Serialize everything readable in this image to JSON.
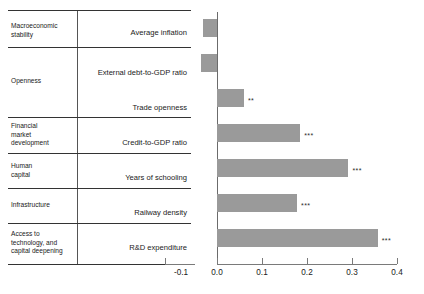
{
  "chart_data": {
    "type": "bar",
    "orientation": "horizontal",
    "title": "",
    "xlabel": "",
    "ylabel": "",
    "xlim": [
      -0.1,
      0.4
    ],
    "grid": false,
    "legend": false,
    "xticks": [
      "-0.1",
      "0.0",
      "0.1",
      "0.2",
      "0.3",
      "0.4"
    ],
    "xtick_values": [
      -0.1,
      0.0,
      0.1,
      0.2,
      0.3,
      0.4
    ],
    "bar_color": "#9a9a9a",
    "axis_color": "#7a7a7a",
    "categories": [
      "Average inflation",
      "External debt-to-GDP ratio",
      "Trade openness",
      "Credit-to-GDP ratio",
      "Years of schooling",
      "Railway density",
      "R&D expenditure"
    ],
    "values": [
      -0.031,
      -0.036,
      0.06,
      0.185,
      0.292,
      0.178,
      0.357
    ],
    "annotations": [
      "",
      "",
      "**",
      "***",
      "***",
      "***",
      "***"
    ],
    "groups": [
      "Macroeconomic stability",
      "Openness",
      "Financial market development",
      "Human capital",
      "Infrastructure",
      "Access to technology, and capital deepening"
    ]
  },
  "table": {
    "groups": [
      {
        "label": "Macroeconomic\nstability",
        "rows": [
          "Average inflation"
        ]
      },
      {
        "label": "Openness",
        "rows": [
          "External debt-to-GDP ratio",
          "Trade openness"
        ]
      },
      {
        "label": "Financial\nmarket\ndevelopment",
        "rows": [
          "Credit-to-GDP ratio"
        ]
      },
      {
        "label": "Human\ncapital",
        "rows": [
          "Years of schooling"
        ]
      },
      {
        "label": "Infrastructure",
        "rows": [
          "Railway density"
        ]
      },
      {
        "label": "Access to\ntechnology, and\ncapital deepening",
        "rows": [
          "R&D expenditure"
        ]
      }
    ],
    "group_labels": [
      "Macroeconomic stability",
      "Openness",
      "Financial market development",
      "Human capital",
      "Infrastructure",
      "Access to technology, and capital deepening"
    ],
    "indicator_labels": [
      "Average inflation",
      "External debt-to-GDP ratio",
      "Trade openness",
      "Credit-to-GDP ratio",
      "Years of schooling",
      "Railway density",
      "R&D expenditure"
    ]
  },
  "group_label_lines": {
    "g0": [
      "Macroeconomic",
      "stability"
    ],
    "g1": [
      "Openness"
    ],
    "g2": [
      "Financial",
      "market",
      "development"
    ],
    "g3": [
      "Human",
      "capital"
    ],
    "g4": [
      "Infrastructure"
    ],
    "g5": [
      "Access to",
      "technology, and",
      "capital deepening"
    ]
  }
}
